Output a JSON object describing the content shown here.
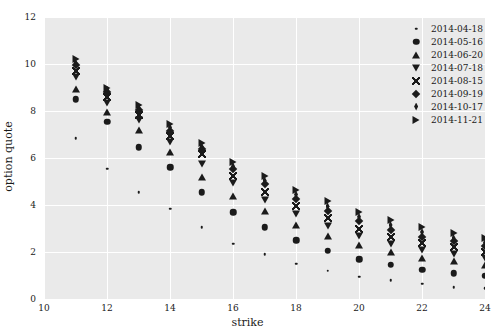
{
  "chart_data": {
    "type": "scatter",
    "title": "",
    "xlabel": "strike",
    "ylabel": "option quote",
    "xlim": [
      10,
      24
    ],
    "ylim": [
      0,
      12
    ],
    "xticks": [
      10,
      12,
      14,
      16,
      18,
      20,
      22,
      24
    ],
    "yticks": [
      0,
      2,
      4,
      6,
      8,
      10,
      12
    ],
    "grid": true,
    "legend_position": "upper right",
    "background_color": "#eaeaea",
    "gridline_color": "#ffffff",
    "marker_color": "#1b1b1b",
    "x": [
      11,
      12,
      13,
      14,
      15,
      16,
      17,
      18,
      19,
      20,
      21,
      22,
      23,
      24
    ],
    "series": [
      {
        "name": "2014-04-18",
        "marker": "point",
        "values": [
          6.85,
          5.55,
          4.55,
          3.85,
          3.05,
          2.35,
          1.9,
          1.5,
          1.2,
          0.95,
          0.8,
          0.65,
          0.5,
          0.45
        ]
      },
      {
        "name": "2014-05-16",
        "marker": "circle",
        "values": [
          8.5,
          7.55,
          6.45,
          5.6,
          4.55,
          3.7,
          3.05,
          2.5,
          2.05,
          1.7,
          1.45,
          1.25,
          1.1,
          1.0
        ]
      },
      {
        "name": "2014-06-20",
        "marker": "triangle-up",
        "values": [
          8.95,
          7.95,
          7.2,
          6.25,
          5.2,
          4.4,
          3.75,
          3.15,
          2.7,
          2.3,
          2.0,
          1.75,
          1.6,
          1.45
        ]
      },
      {
        "name": "2014-07-18",
        "marker": "triangle-down",
        "values": [
          9.45,
          8.35,
          7.6,
          6.7,
          5.75,
          4.95,
          4.2,
          3.6,
          3.1,
          2.7,
          2.35,
          2.1,
          1.9,
          1.75
        ]
      },
      {
        "name": "2014-08-15",
        "marker": "x",
        "values": [
          9.7,
          8.6,
          7.85,
          6.95,
          6.15,
          5.25,
          4.55,
          3.95,
          3.45,
          3.0,
          2.65,
          2.4,
          2.2,
          2.0
        ]
      },
      {
        "name": "2014-09-19",
        "marker": "diamond",
        "values": [
          9.95,
          8.8,
          8.05,
          7.15,
          6.4,
          5.55,
          4.9,
          4.25,
          3.75,
          3.3,
          2.95,
          2.65,
          2.45,
          2.25
        ]
      },
      {
        "name": "2014-10-17",
        "marker": "thin-diamond",
        "values": [
          10.05,
          8.9,
          8.15,
          7.3,
          6.5,
          5.65,
          5.05,
          4.45,
          3.95,
          3.5,
          3.15,
          2.85,
          2.6,
          2.4
        ]
      },
      {
        "name": "2014-11-21",
        "marker": "triangle-right",
        "values": [
          10.2,
          9.0,
          8.25,
          7.45,
          6.65,
          5.85,
          5.25,
          4.65,
          4.15,
          3.7,
          3.35,
          3.05,
          2.8,
          2.6
        ]
      }
    ]
  }
}
